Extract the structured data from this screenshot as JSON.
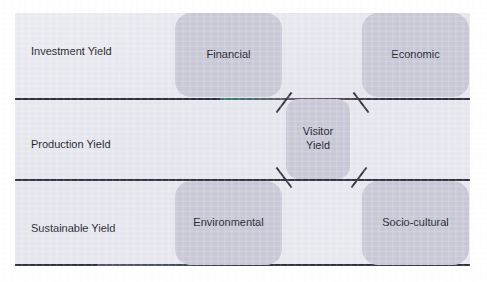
{
  "diagram": {
    "type": "framework-matrix",
    "colors": {
      "page_background": "#ffffff",
      "panel_background": "#e9e9f0",
      "node_fill": "#c9c9d7",
      "rule_color": "#2f3040",
      "text_color": "#1d1d28"
    },
    "rows": [
      {
        "id": "investment",
        "label": "Investment Yield"
      },
      {
        "id": "production",
        "label": "Production Yield"
      },
      {
        "id": "sustainable",
        "label": "Sustainable Yield"
      }
    ],
    "nodes": [
      {
        "id": "financial",
        "label": "Financial",
        "row": "investment",
        "column": "middle"
      },
      {
        "id": "economic",
        "label": "Economic",
        "row": "investment",
        "column": "right"
      },
      {
        "id": "visitor",
        "label": "Visitor Yield",
        "label_line1": "Visitor",
        "label_line2": "Yield",
        "row": "production",
        "column": "center"
      },
      {
        "id": "environmental",
        "label": "Environmental",
        "row": "sustainable",
        "column": "middle"
      },
      {
        "id": "socio",
        "label": "Socio-cultural",
        "row": "sustainable",
        "column": "right"
      }
    ],
    "connectors": [
      {
        "id": "visitor-to-financial",
        "from": "visitor",
        "to": "financial",
        "style": "diagonal-tick"
      },
      {
        "id": "visitor-to-economic",
        "from": "visitor",
        "to": "economic",
        "style": "diagonal-tick"
      },
      {
        "id": "visitor-to-environmental",
        "from": "visitor",
        "to": "environmental",
        "style": "diagonal-tick"
      },
      {
        "id": "visitor-to-socio",
        "from": "visitor",
        "to": "socio",
        "style": "diagonal-tick"
      }
    ],
    "rules": [
      {
        "id": "rule-top",
        "orientation": "horizontal"
      },
      {
        "id": "rule-mid",
        "orientation": "horizontal"
      },
      {
        "id": "rule-bottom",
        "orientation": "horizontal"
      }
    ]
  }
}
